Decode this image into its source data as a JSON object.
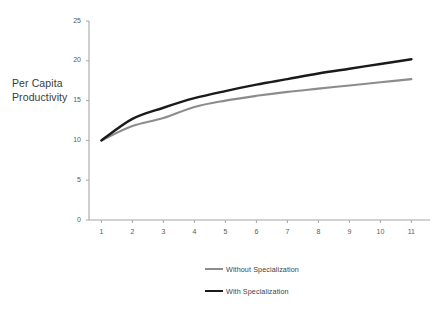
{
  "chart_data": {
    "type": "line",
    "title": "",
    "xlabel": "",
    "ylabel": "Per Capita Productivity",
    "x": [
      1,
      2,
      3,
      4,
      5,
      6,
      7,
      8,
      9,
      10,
      11
    ],
    "xlim": [
      0.6,
      11.6
    ],
    "ylim": [
      0,
      25
    ],
    "yticks": [
      0,
      5,
      10,
      15,
      20,
      25
    ],
    "xticks": [
      1,
      2,
      3,
      4,
      5,
      6,
      7,
      8,
      9,
      10,
      11
    ],
    "grid": false,
    "legend_position": "bottom",
    "series": [
      {
        "name": "Without Specialization",
        "color": "#8c8c8c",
        "values": [
          10.0,
          11.8,
          12.8,
          14.2,
          15.0,
          15.6,
          16.1,
          16.5,
          16.9,
          17.3,
          17.7
        ]
      },
      {
        "name": "With Specialization",
        "color": "#1a1a1a",
        "values": [
          10.0,
          12.7,
          14.1,
          15.3,
          16.2,
          17.0,
          17.7,
          18.4,
          19.0,
          19.6,
          20.2
        ]
      }
    ]
  },
  "axis": {
    "ylabel_line1": "Per Capita",
    "ylabel_line2": "Productivity",
    "y_tick_labels": [
      "0",
      "5",
      "10",
      "15",
      "20",
      "25"
    ],
    "x_tick_labels": [
      "1",
      "2",
      "3",
      "4",
      "5",
      "6",
      "7",
      "8",
      "9",
      "10",
      "11"
    ]
  },
  "legend": {
    "items": [
      {
        "label": "Without Specialization",
        "color": "#8c8c8c"
      },
      {
        "label": "With Specialization",
        "color": "#1a1a1a"
      }
    ]
  },
  "colors": {
    "axis_line": "#a6a6a6",
    "background": "#ffffff",
    "series_without": "#8c8c8c",
    "series_with": "#1a1a1a"
  }
}
